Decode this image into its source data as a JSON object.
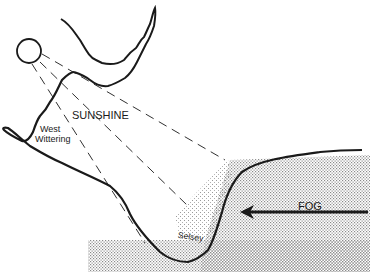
{
  "diagram": {
    "labels": {
      "sunshine": "SUNSHINE",
      "west_wittering_line1": "West",
      "west_wittering_line2": "Wittering",
      "selsey": "Selsey",
      "fog": "FOG"
    },
    "icons": {
      "sun": "sun-circle-icon",
      "fog_arrow": "left-arrow-icon"
    },
    "colors": {
      "ink": "#1a1a1a",
      "fog_dots": "#8a8a8a",
      "background": "#ffffff"
    }
  }
}
